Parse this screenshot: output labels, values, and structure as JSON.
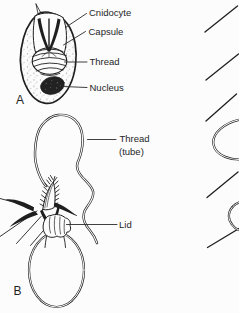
{
  "figure": {
    "type": "biology-line-diagram",
    "panel_a": {
      "letter": "A",
      "labels": {
        "cnidocyte": "Cnidocyte",
        "capsule": "Capsule",
        "thread": "Thread",
        "nucleus": "Nucleus"
      }
    },
    "panel_b": {
      "letter": "B",
      "labels": {
        "thread_tube_line1": "Thread",
        "thread_tube_line2": "(tube)",
        "lid": "Lid"
      }
    },
    "colors": {
      "ink": "#1f1f1f",
      "background": "#fcfcfc",
      "label_text": "#262626",
      "stipple": "#9a9a9a"
    }
  }
}
